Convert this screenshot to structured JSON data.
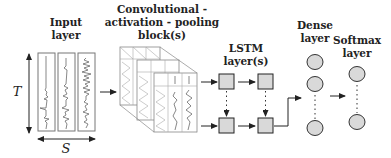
{
  "diagram": {
    "labels": {
      "input": [
        "Input",
        "layer"
      ],
      "conv": [
        "Convolutional -",
        "activation - pooling",
        "block(s)"
      ],
      "lstm": [
        "LSTM",
        "layer(s)"
      ],
      "dense": [
        "Dense",
        "layer"
      ],
      "softmax": [
        "Softmax",
        "layer"
      ]
    },
    "axes": {
      "vertical": "T",
      "horizontal": "S"
    },
    "input_channels": 3,
    "lstm_grid": {
      "rows": 2,
      "cols": 2
    },
    "dense_nodes_visible": 3,
    "softmax_nodes_visible": 2,
    "colors": {
      "node_fill": "#d9d9d9",
      "stroke": "#222222",
      "box_stroke": "#777777"
    }
  }
}
